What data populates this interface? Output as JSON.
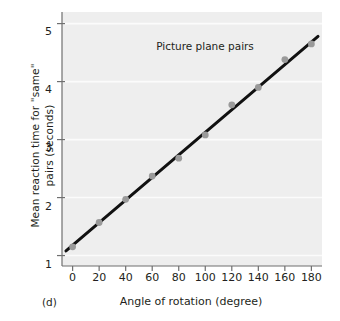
{
  "chart_data": {
    "type": "scatter",
    "title": "",
    "annotation": "Picture plane pairs",
    "panel_letter": "(d)",
    "xlabel": "Angle of rotation (degree)",
    "ylabel": "Mean reaction time for \"same\"\npairs (seconds)",
    "x": [
      0,
      20,
      40,
      60,
      80,
      100,
      120,
      140,
      160,
      180
    ],
    "values": [
      1.15,
      1.57,
      1.97,
      2.37,
      2.68,
      3.08,
      3.6,
      3.9,
      4.38,
      4.65
    ],
    "xticks": [
      "0",
      "20",
      "40",
      "60",
      "80",
      "100",
      "120",
      "140",
      "160",
      "180"
    ],
    "xtick_values": [
      0,
      20,
      40,
      60,
      80,
      100,
      120,
      140,
      160,
      180
    ],
    "yticks": [
      "1",
      "2",
      "3",
      "4",
      "5"
    ],
    "ytick_values": [
      1,
      2,
      3,
      4,
      5
    ],
    "xlim": [
      -8,
      188
    ],
    "ylim": [
      0.82,
      5.2
    ],
    "grid": "horizontal-white",
    "legend": "none",
    "series": [
      {
        "name": "Picture plane pairs",
        "marker": "filled-circle",
        "marker_color": "#9a9a9a",
        "values": [
          1.15,
          1.57,
          1.97,
          2.37,
          2.68,
          3.08,
          3.6,
          3.9,
          4.38,
          4.65
        ]
      }
    ],
    "fit_line": {
      "name": "linear regression line",
      "color": "#111111",
      "x_start": -5,
      "y_start": 1.08,
      "x_end": 185,
      "y_end": 4.78
    },
    "colors": {
      "plot_background": "#eeeeee",
      "page_background": "#ffffff",
      "axis": "#6f6f6f",
      "text": "#231f20",
      "gridline": "#fbfbfb",
      "marker": "#9a9a9a",
      "line": "#111111"
    }
  }
}
